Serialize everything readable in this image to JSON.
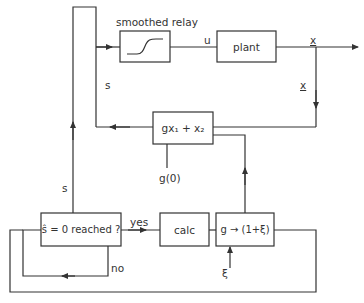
{
  "diagram": {
    "type": "block-diagram",
    "blocks": {
      "relay": {
        "label": "smoothed relay"
      },
      "plant": {
        "label": "plant"
      },
      "switching": {
        "label": "gx₁ + x₂"
      },
      "decision": {
        "label": "ŝ = 0 reached ?"
      },
      "calc": {
        "label": "calc"
      },
      "update": {
        "label": "g → (1+ξ)"
      }
    },
    "signals": {
      "u": "u",
      "x_out": "x",
      "x_feedback": "x",
      "s_upper": "s",
      "s_lower": "s",
      "g0": "g(0)",
      "xi": "ξ",
      "yes": "yes",
      "no": "no"
    }
  }
}
